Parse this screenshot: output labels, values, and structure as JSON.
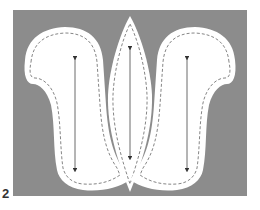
{
  "figure": {
    "label": "2",
    "background_color": "#8c8c8c",
    "piece_fill": "#ffffff",
    "stitch_color": "#666666",
    "arrow_color": "#333333",
    "pieces": [
      {
        "name": "left-side-piece",
        "shape": "s-curve",
        "grainline": "vertical double arrow"
      },
      {
        "name": "center-gusset-piece",
        "shape": "lens",
        "grainline": "vertical double arrow"
      },
      {
        "name": "right-side-piece",
        "shape": "mirrored s-curve",
        "grainline": "vertical double arrow"
      }
    ]
  }
}
